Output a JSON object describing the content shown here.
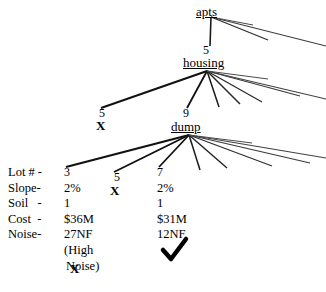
{
  "diagram": {
    "type": "decision-tree",
    "nodes": [
      {
        "id": "apts",
        "label": "apts",
        "x": 211,
        "y": 12
      },
      {
        "id": "housing",
        "label": "housing",
        "x": 210,
        "y": 63
      },
      {
        "id": "dump",
        "label": "dump",
        "x": 192,
        "y": 127
      }
    ],
    "edge_costs": [
      {
        "id": "apts-housing",
        "value": "5",
        "x": 206,
        "y": 50
      },
      {
        "id": "housing-left",
        "value": "5",
        "x": 102,
        "y": 113
      },
      {
        "id": "housing-dump",
        "value": "9",
        "x": 186,
        "y": 113
      },
      {
        "id": "dump-lot3",
        "value": "3",
        "x": 67,
        "y": 172
      },
      {
        "id": "dump-lot5",
        "value": "5",
        "x": 117,
        "y": 177
      },
      {
        "id": "dump-lot7",
        "value": "7",
        "x": 160,
        "y": 172
      }
    ],
    "marks": [
      {
        "id": "reject-housing-left",
        "symbol": "X",
        "x": 99,
        "y": 125
      },
      {
        "id": "reject-lot5",
        "symbol": "X",
        "x": 113,
        "y": 190
      },
      {
        "id": "reject-lot3",
        "symbol": "X",
        "x": 73,
        "y": 268
      },
      {
        "id": "accept-lot7",
        "symbol": "check",
        "x": 163,
        "y": 241
      }
    ],
    "attribute_table": {
      "row_labels": [
        "Lot # -",
        "Slope-",
        "Soil   -",
        "Cost  -",
        "Noise-"
      ],
      "columns": [
        {
          "id": "lot-3",
          "values": [
            "3",
            "2%",
            "1",
            "$36M",
            "27NF"
          ],
          "note_lines": [
            "(High",
            "Noise)"
          ]
        },
        {
          "id": "lot-5",
          "values": [
            "5",
            "",
            "",
            "",
            ""
          ],
          "note_lines": []
        },
        {
          "id": "lot-7",
          "values": [
            "7",
            "2%",
            "1",
            "$31M",
            "12NF"
          ],
          "note_lines": []
        }
      ]
    }
  }
}
